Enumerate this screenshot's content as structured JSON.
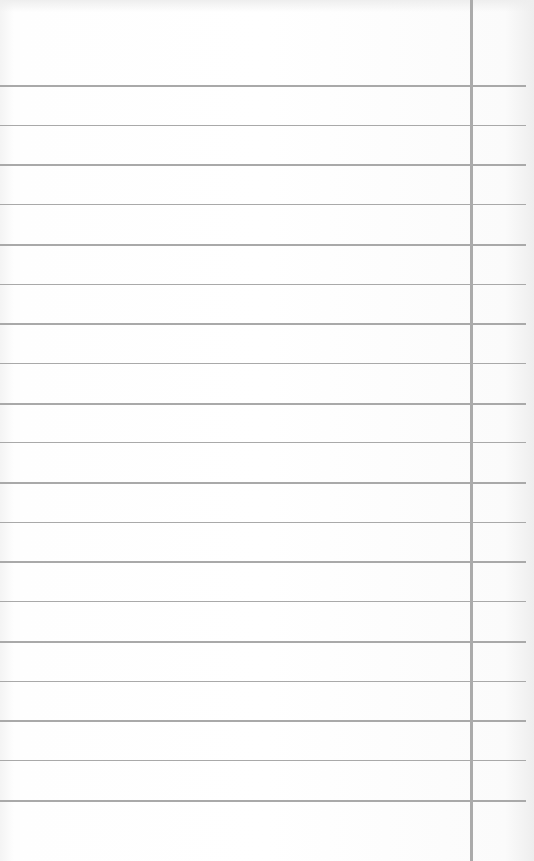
{
  "paper": {
    "type": "lined-notebook-paper",
    "rule_color": "#a9a9a9",
    "margin_line_color": "#ababab",
    "margin_line_x": 470,
    "first_rule_y": 85,
    "rule_spacing": 39.7,
    "rule_count": 19
  }
}
